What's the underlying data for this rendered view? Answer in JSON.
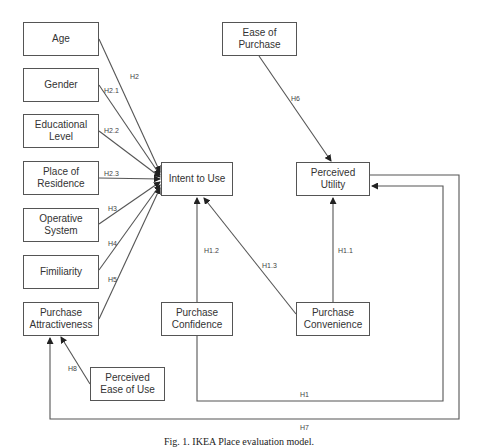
{
  "nodes": {
    "age": "Age",
    "gender": "Gender",
    "educational_level": "Educational Level",
    "place_of_residence": "Place of Residence",
    "operative_system": "Operative System",
    "familiarity": "Fimiliarity",
    "purchase_attractiveness": "Purchase Attractiveness",
    "perceived_ease_of_use": "Perceived Ease of Use",
    "intent_to_use": "Intent to Use",
    "purchase_confidence": "Purchase Confidence",
    "ease_of_purchase": "Ease of Purchase",
    "perceived_utility": "Perceived Utility",
    "purchase_convenience": "Purchase Convenience"
  },
  "edges": [
    {
      "id": "H2",
      "from": "age",
      "to": "intent_to_use",
      "label": "H2"
    },
    {
      "id": "H2.1",
      "from": "gender",
      "to": "intent_to_use",
      "label": "H2.1"
    },
    {
      "id": "H2.2",
      "from": "educational_level",
      "to": "intent_to_use",
      "label": "H2.2"
    },
    {
      "id": "H2.3",
      "from": "place_of_residence",
      "to": "intent_to_use",
      "label": "H2.3"
    },
    {
      "id": "H3",
      "from": "operative_system",
      "to": "intent_to_use",
      "label": "H3"
    },
    {
      "id": "H4",
      "from": "familiarity",
      "to": "intent_to_use",
      "label": "H4"
    },
    {
      "id": "H5",
      "from": "purchase_attractiveness",
      "to": "intent_to_use",
      "label": "H5"
    },
    {
      "id": "H1.2",
      "from": "purchase_confidence",
      "to": "intent_to_use",
      "label": "H1.2"
    },
    {
      "id": "H1.3",
      "from": "purchase_convenience",
      "to": "intent_to_use",
      "label": "H1.3"
    },
    {
      "id": "H1.1",
      "from": "purchase_convenience",
      "to": "perceived_utility",
      "label": "H1.1"
    },
    {
      "id": "H6",
      "from": "ease_of_purchase",
      "to": "perceived_utility",
      "label": "H6"
    },
    {
      "id": "H8",
      "from": "perceived_ease_of_use",
      "to": "purchase_attractiveness",
      "label": "H8"
    },
    {
      "id": "H1",
      "from": "purchase_confidence",
      "to": "perceived_utility",
      "label": "H1"
    },
    {
      "id": "H7",
      "from": "perceived_utility",
      "to": "purchase_attractiveness",
      "label": "H7"
    }
  ],
  "caption": "Fig. 1. IKEA Place evaluation model."
}
